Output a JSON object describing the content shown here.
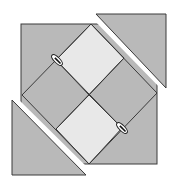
{
  "diagram": {
    "type": "quilt-block-geometric",
    "colors": {
      "background": "#ffffff",
      "dark_fill": "#b9b9b9",
      "light_fill": "#e8e8e8",
      "outline": "#3a3a3a",
      "marker_fill": "#ffffff",
      "marker_stroke": "#222222"
    },
    "pieces": [
      {
        "name": "main-square-bg",
        "shade": "dark"
      },
      {
        "name": "diamond-top-right",
        "shade": "light"
      },
      {
        "name": "diamond-bottom-left",
        "shade": "light"
      },
      {
        "name": "triangle-top-right",
        "shade": "dark"
      },
      {
        "name": "triangle-bottom-left",
        "shade": "dark"
      }
    ],
    "markers": [
      {
        "name": "seam-marker-upper-left",
        "cx": 57,
        "cy": 60
      },
      {
        "name": "seam-marker-lower-right",
        "cx": 122,
        "cy": 128
      }
    ]
  }
}
